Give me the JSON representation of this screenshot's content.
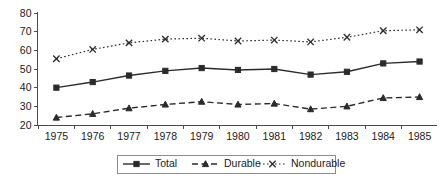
{
  "chart_data": {
    "type": "line",
    "title": "",
    "xlabel": "",
    "ylabel": "",
    "categories": [
      "1975",
      "1976",
      "1977",
      "1978",
      "1979",
      "1980",
      "1981",
      "1982",
      "1983",
      "1984",
      "1985"
    ],
    "x": [
      1975,
      1976,
      1977,
      1978,
      1979,
      1980,
      1981,
      1982,
      1983,
      1984,
      1985
    ],
    "series": [
      {
        "name": "Total",
        "marker": "square",
        "linestyle": "solid",
        "values": [
          40,
          43,
          46.5,
          49,
          50.5,
          49.5,
          50,
          47,
          48.5,
          53,
          54
        ]
      },
      {
        "name": "Durable",
        "marker": "triangle",
        "linestyle": "dashed",
        "values": [
          24,
          26,
          29,
          31,
          32.5,
          31,
          31.5,
          28.5,
          30,
          34.5,
          35
        ]
      },
      {
        "name": "Nondurable",
        "marker": "x",
        "linestyle": "dotted",
        "values": [
          55.5,
          60.5,
          64,
          66,
          66.5,
          65,
          65.5,
          64.5,
          67,
          70.5,
          71
        ]
      }
    ],
    "ylim": [
      20,
      80
    ],
    "yticks": [
      20,
      30,
      40,
      50,
      60,
      70,
      80
    ],
    "ytick_labels": [
      "20",
      "30",
      "40",
      "50",
      "60",
      "70",
      "80"
    ],
    "xtick_labels": [
      "1975",
      "1976",
      "1977",
      "1978",
      "1979",
      "1980",
      "1981",
      "1982",
      "1983",
      "1984",
      "1985"
    ],
    "grid": false,
    "legend_position": "bottom-center",
    "legend_entries": [
      "Total",
      "Durable",
      "Nondurable"
    ],
    "colors": {
      "line": "#2b2b2b",
      "axis": "#4a4a4a",
      "text": "#1a1a1a",
      "legend_border": "#8c8c8c",
      "background": "#ffffff"
    }
  }
}
